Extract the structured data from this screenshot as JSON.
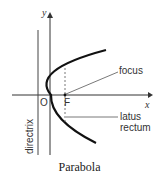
{
  "diagram": {
    "axis_y_label": "y",
    "axis_x_label": "x",
    "origin_label": "O",
    "focus_point_label": "F",
    "focus_callout": "focus",
    "latus_callout_line1": "latus",
    "latus_callout_line2": "rectum",
    "directrix_label": "directrix",
    "caption": "Parabola"
  }
}
